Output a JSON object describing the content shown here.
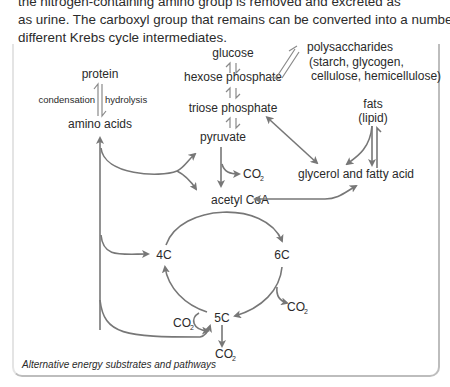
{
  "intro": {
    "line0": "the nitrogen-containing amino group is removed and excreted as",
    "line1": "as urine. The carboxyl group that remains can be converted into a number of",
    "line2": "different Krebs cycle intermediates."
  },
  "diagram": {
    "caption": "Alternative energy substrates and pathways",
    "nodes": {
      "glucose": "glucose",
      "hexose_phosphate": "hexose phosphate",
      "triose_phosphate": "triose phosphate",
      "pyruvate": "pyruvate",
      "acetyl_coa": "acetyl CoA",
      "protein": "protein",
      "amino_acids": "amino acids",
      "polysaccharides": "polysaccharides",
      "polysaccharides_detail_1": "(starch, glycogen,",
      "polysaccharides_detail_2": "cellulose, hemicellulose)",
      "fats": "fats",
      "lipid": "(lipid)",
      "glycerol_fatty_acid": "glycerol and fatty acid",
      "c4": "4C",
      "c5": "5C",
      "c6": "6C"
    },
    "labels": {
      "condensation": "condensation",
      "hydrolysis": "hydrolysis",
      "co2_main": "CO",
      "co2_sub": "2"
    },
    "colors": {
      "arrow": "#777777",
      "text": "#2a2a2a",
      "border": "#bdbdbd"
    }
  }
}
